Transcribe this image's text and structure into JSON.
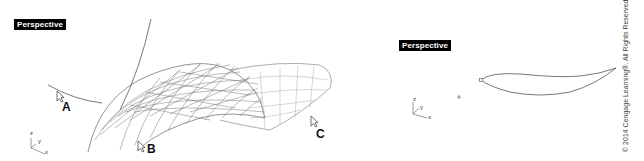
{
  "viewports": [
    {
      "id": "left",
      "title": "Perspective",
      "callouts": [
        "A",
        "B",
        "C"
      ],
      "axis": {
        "z": "z",
        "y": "y",
        "x": "x"
      }
    },
    {
      "id": "right",
      "title": "Perspective",
      "axis": {
        "z": "z",
        "y": "y",
        "x": "x"
      }
    }
  ],
  "copyright": "© 2014 Cengage Learning®. All Rights Reserved.",
  "colors": {
    "line": "#555555",
    "title_bg": "#000000",
    "title_fg": "#ffffff"
  }
}
